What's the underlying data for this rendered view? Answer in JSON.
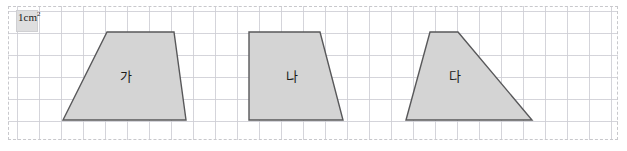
{
  "legend": {
    "unit_value": "1",
    "unit_text": "cm",
    "unit_exponent": "2",
    "unit_full": "1 cm²",
    "swatch_fill": "#dededf"
  },
  "grid": {
    "cell_size_px": 22,
    "line_color": "#cdcdd4",
    "frame_style": "dashed",
    "frame_color": "#c8c8cc"
  },
  "style": {
    "shape_fill": "#d4d4d4",
    "shape_stroke": "#58585a",
    "label_color": "#1b1b1b",
    "background": "#ffffff"
  },
  "shapes": [
    {
      "id": "shape-ga",
      "label": "가",
      "kind": "trapezoid",
      "points": "63,120 107,32 174,32 186,120",
      "label_x": 126,
      "label_y": 77,
      "top_width_cm": 3,
      "bottom_width_cm": 5.6,
      "height_cm": 4
    },
    {
      "id": "shape-na",
      "label": "나",
      "kind": "trapezoid",
      "points": "249,120 249,32 320,32 343,120",
      "label_x": 292,
      "label_y": 77,
      "top_width_cm": 3.2,
      "bottom_width_cm": 4.3,
      "height_cm": 4
    },
    {
      "id": "shape-da",
      "label": "다",
      "kind": "trapezoid",
      "points": "406,120 430,32 458,32 532,120",
      "label_x": 455,
      "label_y": 77,
      "top_width_cm": 1.3,
      "bottom_width_cm": 5.7,
      "height_cm": 4
    }
  ]
}
